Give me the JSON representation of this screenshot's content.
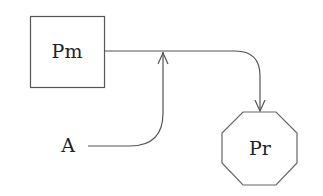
{
  "diagram": {
    "nodes": [
      {
        "id": "pm",
        "label": "Pm",
        "shape": "square"
      },
      {
        "id": "pr",
        "label": "Pr",
        "shape": "octagon"
      },
      {
        "id": "a",
        "label": "A",
        "shape": "none"
      }
    ],
    "edges": [
      {
        "from": "pm",
        "to": "pr",
        "style": "line with rounded corner, arrowhead at Pr"
      },
      {
        "from": "a",
        "to": "pm-pr-edge",
        "style": "curved line joining edge from below, arrowhead at junction"
      }
    ],
    "colors": {
      "stroke": "#555555",
      "text": "#222222",
      "background": "#ffffff"
    }
  }
}
